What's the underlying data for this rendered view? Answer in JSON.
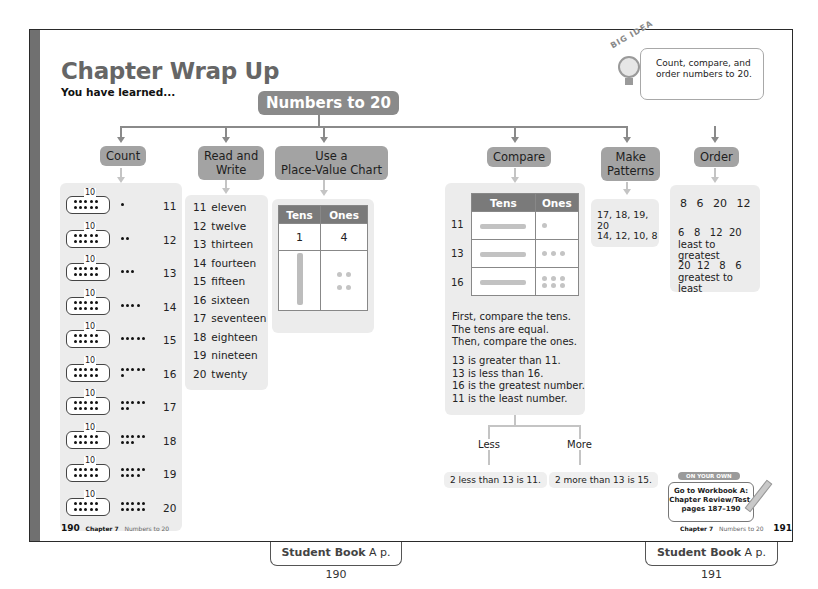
{
  "page": {
    "title": "Chapter Wrap Up",
    "subtitle": "You have learned..."
  },
  "big_idea": {
    "label": "BIG IDEA",
    "text": "Count, compare, and order numbers to 20.",
    "icon": "lightbulb-icon"
  },
  "concept_map": {
    "root": "Numbers to 20",
    "branches": [
      {
        "label": "Count"
      },
      {
        "label_line1": "Read and",
        "label_line2": "Write"
      },
      {
        "label_line1": "Use a",
        "label_line2": "Place-Value Chart"
      },
      {
        "label": "Compare"
      },
      {
        "label_line1": "Make",
        "label_line2": "Patterns"
      },
      {
        "label": "Order"
      }
    ]
  },
  "count": {
    "tenframe_label": "10",
    "rows": [
      {
        "extra": 1,
        "number": "11"
      },
      {
        "extra": 2,
        "number": "12"
      },
      {
        "extra": 3,
        "number": "13"
      },
      {
        "extra": 4,
        "number": "14"
      },
      {
        "extra": 5,
        "number": "15"
      },
      {
        "extra": 6,
        "number": "16"
      },
      {
        "extra": 7,
        "number": "17"
      },
      {
        "extra": 8,
        "number": "18"
      },
      {
        "extra": 9,
        "number": "19"
      },
      {
        "extra": 10,
        "number": "20"
      }
    ]
  },
  "read_write": {
    "rows": [
      {
        "num": "11",
        "word": "eleven"
      },
      {
        "num": "12",
        "word": "twelve"
      },
      {
        "num": "13",
        "word": "thirteen"
      },
      {
        "num": "14",
        "word": "fourteen"
      },
      {
        "num": "15",
        "word": "fifteen"
      },
      {
        "num": "16",
        "word": "sixteen"
      },
      {
        "num": "17",
        "word": "seventeen"
      },
      {
        "num": "18",
        "word": "eighteen"
      },
      {
        "num": "19",
        "word": "nineteen"
      },
      {
        "num": "20",
        "word": "twenty"
      }
    ]
  },
  "place_value": {
    "headers": [
      "Tens",
      "Ones"
    ],
    "values": [
      "1",
      "4"
    ]
  },
  "compare": {
    "headers": [
      "Tens",
      "Ones"
    ],
    "rows": [
      {
        "label": "11",
        "ones": 1
      },
      {
        "label": "13",
        "ones": 3
      },
      {
        "label": "16",
        "ones": 6
      }
    ],
    "steps": [
      "First, compare the tens.",
      "The tens are equal.",
      "Then, compare the ones."
    ],
    "statements": [
      "13 is greater than 11.",
      "13 is less than 16.",
      "16 is the greatest number.",
      "11 is the least number."
    ],
    "less_label": "Less",
    "more_label": "More",
    "less_example": "2 less than 13 is 11.",
    "more_example": "2 more than 13 is 15."
  },
  "patterns": {
    "rows": [
      "17, 18, 19, 20",
      "14, 12, 10, 8"
    ]
  },
  "order": {
    "numbers": [
      "8",
      "6",
      "20",
      "12"
    ],
    "ascending": "6   8   12  20",
    "ascending_label": "least to greatest",
    "descending": "20  12   8   6",
    "descending_label": "greatest to least"
  },
  "on_your_own": {
    "tag": "ON YOUR OWN",
    "line1": "Go to Workbook A:",
    "line2": "Chapter Review/Test,",
    "line3": "pages 187–190"
  },
  "footer_left": {
    "page": "190",
    "chapter": "Chapter 7",
    "topic": "Numbers to 20"
  },
  "footer_right": {
    "page": "191",
    "chapter": "Chapter 7",
    "topic": "Numbers to 20"
  },
  "tabs": [
    {
      "book": "Student Book",
      "letter": "A",
      "page": "p. 190"
    },
    {
      "book": "Student Book",
      "letter": "A",
      "page": "p. 191"
    }
  ]
}
